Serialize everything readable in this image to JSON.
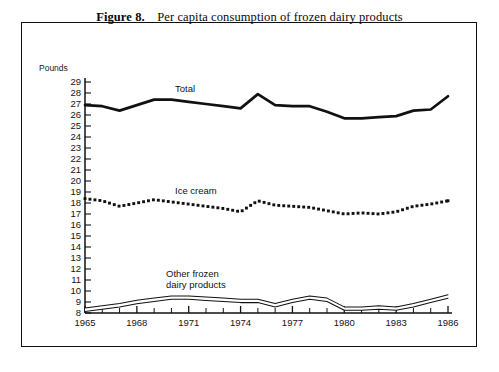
{
  "figure": {
    "number_label": "Figure 8.",
    "title": "Per capita consumption of frozen dairy products"
  },
  "axes": {
    "y_axis_title": "Pounds",
    "y_ticks": [
      29,
      28,
      27,
      26,
      25,
      24,
      23,
      22,
      21,
      20,
      19,
      18,
      17,
      16,
      15,
      14,
      13,
      12,
      11,
      10,
      9,
      8
    ],
    "x_ticks_labeled": [
      1965,
      1968,
      1971,
      1974,
      1977,
      1980,
      1983,
      1986
    ]
  },
  "series_labels": {
    "total": "Total",
    "ice_cream": "Ice cream",
    "other_line1": "Other frozen",
    "other_line2": "dairy products"
  },
  "colors": {
    "ink": "#111111",
    "paper": "#ffffff"
  },
  "chart_data": {
    "type": "line",
    "title": "Figure 8. Per capita consumption of frozen dairy products",
    "xlabel": "",
    "ylabel": "Pounds",
    "xlim": [
      1965,
      1986
    ],
    "ylim": [
      8,
      29
    ],
    "grid": false,
    "legend": "inline-labels",
    "x": [
      1965,
      1966,
      1967,
      1968,
      1969,
      1970,
      1971,
      1972,
      1973,
      1974,
      1975,
      1976,
      1977,
      1978,
      1979,
      1980,
      1981,
      1982,
      1983,
      1984,
      1985,
      1986
    ],
    "series": [
      {
        "name": "Total",
        "style": "thick-solid",
        "values": [
          26.9,
          26.8,
          26.4,
          26.9,
          27.4,
          27.4,
          27.2,
          27.0,
          26.8,
          26.6,
          27.9,
          26.9,
          26.8,
          26.8,
          26.3,
          25.7,
          25.7,
          25.8,
          25.9,
          26.4,
          26.5,
          27.7
        ]
      },
      {
        "name": "Ice cream",
        "style": "square-dotted",
        "values": [
          18.4,
          18.2,
          17.7,
          18.0,
          18.3,
          18.1,
          17.9,
          17.7,
          17.5,
          17.2,
          18.2,
          17.8,
          17.7,
          17.6,
          17.3,
          17.0,
          17.1,
          17.0,
          17.2,
          17.7,
          17.9,
          18.2
        ]
      },
      {
        "name": "Other frozen dairy products",
        "style": "thin-outlined-band",
        "values": [
          8.3,
          8.5,
          8.7,
          9.0,
          9.2,
          9.4,
          9.4,
          9.3,
          9.2,
          9.1,
          9.1,
          8.7,
          9.1,
          9.4,
          9.2,
          8.4,
          8.4,
          8.5,
          8.4,
          8.7,
          9.1,
          9.5
        ]
      }
    ]
  }
}
